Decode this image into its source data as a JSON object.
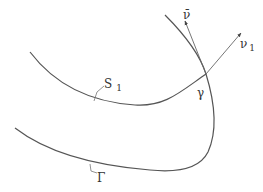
{
  "diagram": {
    "labels": {
      "nu_bar": "ν̄",
      "nu_1": "ν",
      "nu_1_sub": "1",
      "S_1": "S",
      "S_1_sub": "1",
      "gamma": "γ",
      "Gamma": "Γ"
    },
    "colors": {
      "curve": "#555555",
      "text": "#333333",
      "background": "#ffffff"
    }
  }
}
